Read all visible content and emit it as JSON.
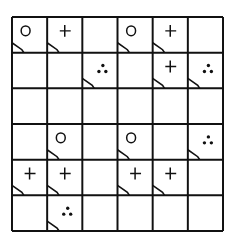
{
  "grid": {
    "rows": 6,
    "cols": 6,
    "line_color": "#111111",
    "cells": [
      [
        {
          "symbol": "circle",
          "notch": true
        },
        {
          "symbol": "plus",
          "notch": true
        },
        {
          "symbol": "",
          "notch": false
        },
        {
          "symbol": "circle",
          "notch": true
        },
        {
          "symbol": "plus",
          "notch": true
        },
        {
          "symbol": "",
          "notch": false
        }
      ],
      [
        {
          "symbol": "",
          "notch": false
        },
        {
          "symbol": "",
          "notch": false
        },
        {
          "symbol": "dots",
          "notch": true
        },
        {
          "symbol": "",
          "notch": false
        },
        {
          "symbol": "plus",
          "notch": true
        },
        {
          "symbol": "dots",
          "notch": true
        }
      ],
      [
        {
          "symbol": "",
          "notch": false
        },
        {
          "symbol": "",
          "notch": false
        },
        {
          "symbol": "",
          "notch": false
        },
        {
          "symbol": "",
          "notch": false
        },
        {
          "symbol": "",
          "notch": false
        },
        {
          "symbol": "",
          "notch": false
        }
      ],
      [
        {
          "symbol": "",
          "notch": false
        },
        {
          "symbol": "circle",
          "notch": true
        },
        {
          "symbol": "",
          "notch": false
        },
        {
          "symbol": "circle",
          "notch": true
        },
        {
          "symbol": "",
          "notch": false
        },
        {
          "symbol": "dots",
          "notch": true
        }
      ],
      [
        {
          "symbol": "plus",
          "notch": true
        },
        {
          "symbol": "plus",
          "notch": true
        },
        {
          "symbol": "",
          "notch": false
        },
        {
          "symbol": "plus",
          "notch": true
        },
        {
          "symbol": "plus",
          "notch": true
        },
        {
          "symbol": "",
          "notch": false
        }
      ],
      [
        {
          "symbol": "",
          "notch": false
        },
        {
          "symbol": "dots",
          "notch": true
        },
        {
          "symbol": "",
          "notch": false
        },
        {
          "symbol": "",
          "notch": false
        },
        {
          "symbol": "",
          "notch": false
        },
        {
          "symbol": "",
          "notch": false
        }
      ]
    ]
  }
}
